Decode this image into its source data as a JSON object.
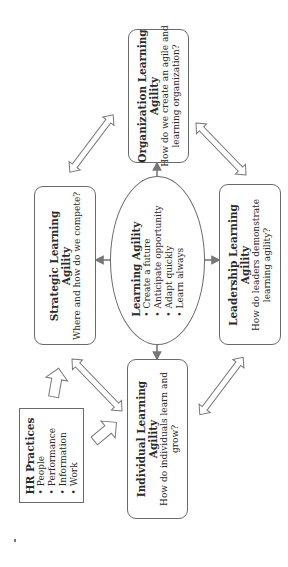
{
  "center": {
    "title": "Learning Agility",
    "bullets": [
      "Create a future",
      "Anticipate opportunity",
      "Adapt quickly",
      "Learn always"
    ]
  },
  "organization": {
    "title_line1": "Organization Learning",
    "title_line2": "Agility",
    "question_line1": "How do we create an agile and",
    "question_line2": "learning organization?"
  },
  "strategic": {
    "title_line1": "Strategic Learning",
    "title_line2": "Agility",
    "question_line1": "Where and how do we compete?"
  },
  "leadership": {
    "title_line1": "Leadership Learning",
    "title_line2": "Agility",
    "question_line1": "How do leaders demonstrate",
    "question_line2": "learning agility?"
  },
  "individual": {
    "title_line1": "Individual Learning",
    "title_line2": "Agility",
    "question_line1": "How do individuals learn and",
    "question_line2": "grow?"
  },
  "hr_practices": {
    "title": "HR Practices",
    "bullets": [
      "People",
      "Performance",
      "Information",
      "Work"
    ]
  },
  "colors": {
    "stroke": "#6a6a6a",
    "text": "#2a2a2a",
    "background": "#ffffff"
  }
}
